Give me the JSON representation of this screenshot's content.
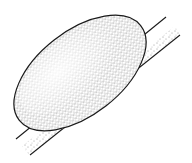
{
  "figure": {
    "colors": {
      "background": "#ffffff",
      "stroke": "#1a1a1a",
      "stipple": "#2a2a2a"
    },
    "surface_line": {
      "x1": 16,
      "y1": 139,
      "x2": 166,
      "y2": 17
    },
    "substrate_bottom_line": {
      "x1": 30,
      "y1": 155,
      "x2": 180,
      "y2": 35
    },
    "droplet": {
      "cx": 80,
      "cy": 73,
      "rx": 77,
      "ry": 42,
      "angle": -38
    }
  }
}
